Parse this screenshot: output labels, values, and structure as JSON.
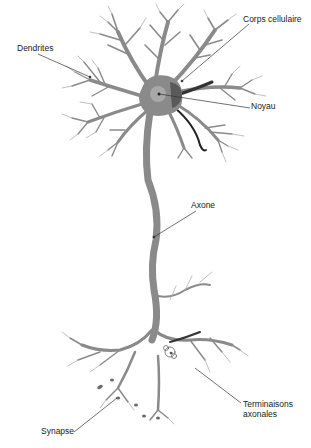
{
  "colors": {
    "background": "#ffffff",
    "neuron_fill": "#8a8a8a",
    "neuron_dark": "#555555",
    "neuron_light": "#b5b5b5",
    "nucleus_fill": "#a8a8a8",
    "leader_line": "#333333",
    "label_text": "#1a1a1a"
  },
  "labels": {
    "corps_cellulaire": "Corps cellulaire",
    "dendrites": "Dendrites",
    "noyau": "Noyau",
    "axone": "Axone",
    "terminaisons_line1": "Terminaisons",
    "terminaisons_line2": "axonales",
    "synapse": "Synapse"
  },
  "annotations": [
    {
      "id": "corps_cellulaire",
      "target": "cell body"
    },
    {
      "id": "dendrites",
      "target": "dendrite branches"
    },
    {
      "id": "noyau",
      "target": "nucleus"
    },
    {
      "id": "axone",
      "target": "axon"
    },
    {
      "id": "terminaisons_axonales",
      "target": "axon terminals"
    },
    {
      "id": "synapse",
      "target": "synaptic bouton"
    }
  ]
}
